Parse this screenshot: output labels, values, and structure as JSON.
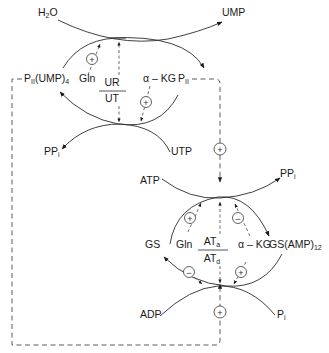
{
  "diagram": {
    "upper_cycle": {
      "enzyme_numerator": "UR",
      "enzyme_denominator": "UT",
      "substrate_in": "H",
      "substrate_in_sub": "2",
      "substrate_in_tail": "O",
      "product_out": "UMP",
      "cofactor_in": "UTP",
      "cofactor_out": "PP",
      "cofactor_out_sub": "i",
      "left_species": "P",
      "left_species_sub": "II",
      "left_species_tail": "(UMP)",
      "left_species_tail_sub": "4",
      "right_species": "P",
      "right_species_sub": "II",
      "effector_left": "Gln",
      "effector_right": "α – KG",
      "effector_left_sign": "+",
      "effector_right_sign": "+"
    },
    "link": {
      "sign": "+"
    },
    "lower_cycle": {
      "enzyme_numerator": "AT",
      "enzyme_numerator_sub": "a",
      "enzyme_denominator": "AT",
      "enzyme_denominator_sub": "d",
      "cofactor_in": "ATP",
      "cofactor_out": "PP",
      "cofactor_out_sub": "i",
      "bottom_in": "ADP",
      "bottom_out": "P",
      "bottom_out_sub": "i",
      "left_species": "GS",
      "right_species": "GS(AMP)",
      "right_species_sub": "12",
      "effector_left": "Gln",
      "effector_right": "α – KG",
      "upper_left_sign": "+",
      "upper_right_sign": "−",
      "lower_left_sign": "−",
      "lower_right_sign": "+",
      "bottom_link_sign": "+"
    }
  }
}
